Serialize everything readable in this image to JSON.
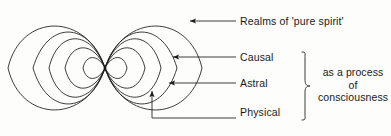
{
  "figure": {
    "background_color": "#fdfdfb",
    "stroke_color": "#1a1a1a"
  },
  "labels": {
    "realms": "Realms of 'pure spirit'",
    "causal": "Causal",
    "astral": "Astral",
    "physical": "Physical"
  },
  "group_note": {
    "line1": "as a process",
    "line2": "of",
    "line3": "consciousness"
  },
  "diagram": {
    "type": "lemniscate",
    "node": {
      "x": 105,
      "y": 68
    },
    "lobes": 2,
    "loops_per_lobe": 5,
    "loop_half_widths": [
      22,
      40,
      56,
      72,
      97
    ],
    "loop_half_heights": [
      14,
      27,
      39,
      48,
      56
    ],
    "left_extent_x": 8,
    "right_extent_x": 202,
    "top_extent_y": 12,
    "bottom_extent_y": 124
  },
  "leaders": [
    {
      "name": "realms",
      "arrow_tip": {
        "x": 189,
        "y": 21
      },
      "line_end": {
        "x": 236,
        "y": 21
      },
      "elbow": false
    },
    {
      "name": "causal",
      "arrow_tip": {
        "x": 172,
        "y": 57
      },
      "line_end": {
        "x": 236,
        "y": 57
      },
      "elbow": false
    },
    {
      "name": "astral",
      "arrow_tip": {
        "x": 168,
        "y": 83
      },
      "line_end": {
        "x": 236,
        "y": 83
      },
      "elbow": false
    },
    {
      "name": "physical",
      "arrow_tip": {
        "x": 152,
        "y": 90
      },
      "elbow_corner": {
        "x": 152,
        "y": 118
      },
      "line_end": {
        "x": 236,
        "y": 118
      },
      "elbow": true
    }
  ],
  "brace": {
    "top_y": 52,
    "bottom_y": 120,
    "x": 305,
    "pointer_y": 86,
    "groups": [
      "causal",
      "astral",
      "physical"
    ]
  }
}
